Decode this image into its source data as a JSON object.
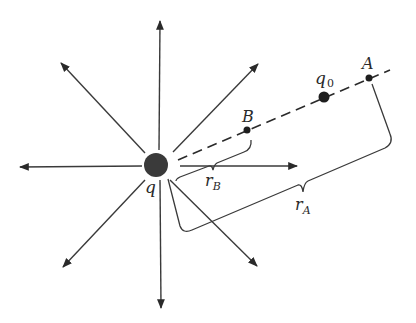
{
  "diagram": {
    "charges": {
      "source": {
        "label": "q",
        "x": 156,
        "y": 165,
        "r": 12
      },
      "test": {
        "label": "q",
        "sub": "0",
        "x": 324,
        "y": 97,
        "r": 5
      }
    },
    "points": {
      "A": {
        "label": "A",
        "x": 369,
        "y": 78
      },
      "B": {
        "label": "B",
        "x": 247,
        "y": 130
      }
    },
    "distances": {
      "rA": {
        "label": "r",
        "sub": "A"
      },
      "rB": {
        "label": "r",
        "sub": "B"
      }
    },
    "field_lines": [
      {
        "name": "up",
        "x2": 160,
        "y2": 21
      },
      {
        "name": "down",
        "x2": 161,
        "y2": 308
      },
      {
        "name": "left",
        "x2": 20,
        "y2": 167
      },
      {
        "name": "right",
        "x2": 297,
        "y2": 166
      },
      {
        "name": "up-left",
        "x2": 61,
        "y2": 63
      },
      {
        "name": "up-right",
        "x2": 258,
        "y2": 64
      },
      {
        "name": "down-left",
        "x2": 63,
        "y2": 267
      },
      {
        "name": "down-right",
        "x2": 257,
        "y2": 266
      }
    ],
    "colors": {
      "ink": "#2a2a2a",
      "dot": "#1e1e1e",
      "charge": "#3a3a3a"
    }
  }
}
